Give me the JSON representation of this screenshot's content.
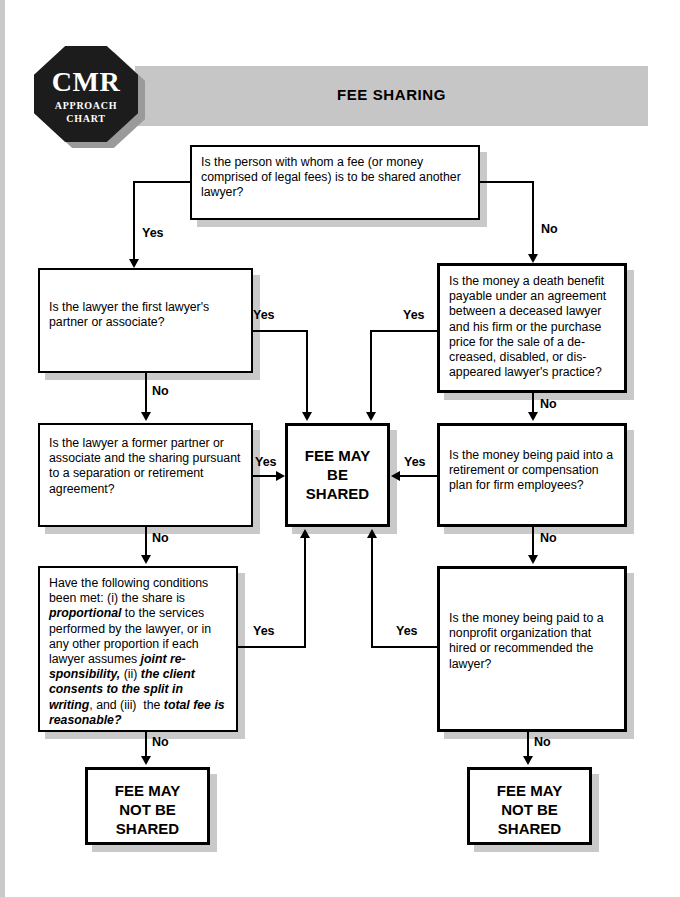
{
  "header": {
    "title": "FEE SHARING",
    "logo": {
      "main": "CMR",
      "sub_line1": "APPROACH",
      "sub_line2": "CHART"
    }
  },
  "nodes": {
    "start": {
      "id": "start",
      "text": "Is the person with whom a fee (or money comprised of legal fees) is to be shared another lawyer?"
    },
    "left1": {
      "id": "left1",
      "text": "Is the lawyer the first lawyer's partner or associate?"
    },
    "left2": {
      "id": "left2",
      "text": "Is the lawyer a former partner or associate and the sharing pursuant to a separation or retirement agreement?"
    },
    "left3": {
      "id": "left3",
      "text": "Have the following conditions been met: (i) the share is proportional to the services performed by the lawyer, or in any other proportion if each lawyer assumes joint responsibility, (ii) the client consents to the split in writing, and (iii) the total fee is reasonable?",
      "emphasis": [
        "proportional",
        "joint responsibility,",
        "the client consents to the split in writing",
        "total fee is reasonable?"
      ]
    },
    "right1": {
      "id": "right1",
      "text": "Is the money a death benefit payable under an agreement between a deceased lawyer and his firm or the purchase price for the sale of a deceased, disabled, or disappeared lawyer's practice?"
    },
    "right2": {
      "id": "right2",
      "text": "Is the money being paid into a retirement or compensation plan for firm employees?"
    },
    "right3": {
      "id": "right3",
      "text": "Is the money being paid to a nonprofit organization that hired or recommended the lawyer?"
    },
    "shared": {
      "id": "shared",
      "text": "FEE MAY BE SHARED"
    },
    "not_shared_left": {
      "id": "not_shared_left",
      "text": "FEE MAY NOT BE SHARED"
    },
    "not_shared_right": {
      "id": "not_shared_right",
      "text": "FEE MAY NOT BE SHARED"
    }
  },
  "edge_labels": {
    "start_yes": "Yes",
    "start_no": "No",
    "left1_yes": "Yes",
    "left1_no": "No",
    "left2_yes": "Yes",
    "left2_no": "No",
    "left3_yes": "Yes",
    "left3_no": "No",
    "right1_yes": "Yes",
    "right1_no": "No",
    "right2_yes": "Yes",
    "right2_no": "No",
    "right3_yes": "Yes",
    "right3_no": "No"
  },
  "colors": {
    "page_background": "#ffffff",
    "title_bar": "#c6c6c6",
    "logo_fill": "#1c1c1c",
    "box_border": "#000000",
    "box_shadow": "#c9c9c9",
    "text": "#000000"
  }
}
